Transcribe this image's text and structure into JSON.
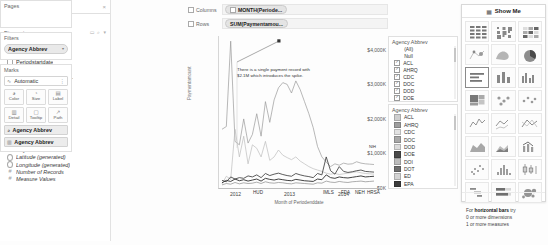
{
  "data_pane": {
    "tabs": [
      {
        "label": "Data",
        "active": true
      },
      {
        "label": "Analytics",
        "active": false
      }
    ],
    "close_glyph": "×",
    "datasource": "OSU_vendor",
    "dimensions_label": "Dimensions",
    "measures_label": "Measures",
    "group_tools": [
      "▭",
      "⌕",
      "▾"
    ],
    "dimensions": [
      {
        "name": "Agency Abbrev",
        "icon": "abc-icon"
      },
      {
        "name": "Agency Text",
        "icon": "abc-icon"
      },
      {
        "name": "Periodenddate",
        "icon": "calendar-icon"
      },
      {
        "name": "Periodstartdate",
        "icon": "calendar-icon"
      },
      {
        "name": "Program Title",
        "icon": "abc-icon"
      },
      {
        "name": "Recipientaccountnum...",
        "icon": "abc-icon"
      },
      {
        "name": "Statecode",
        "icon": "abc-icon"
      },
      {
        "name": "StateName",
        "icon": "globe-icon"
      },
      {
        "name": "Sub Agency Text",
        "icon": "abc-icon"
      }
    ],
    "measures": [
      {
        "name": "Agency",
        "icon": "hash-icon",
        "italic": false
      },
      {
        "name": "Cfda",
        "icon": "hash-icon",
        "italic": false
      },
      {
        "name": "Countycode",
        "icon": "hash-icon",
        "italic": false
      },
      {
        "name": "Fipscode",
        "icon": "hash-icon",
        "italic": false
      },
      {
        "name": "Institutionid",
        "icon": "hash-icon",
        "italic": false
      },
      {
        "name": "Paymentamount",
        "icon": "hash-icon",
        "italic": false
      },
      {
        "name": "Latitude (generated)",
        "icon": "globe-icon",
        "italic": true
      },
      {
        "name": "Longitude (generated)",
        "icon": "globe-icon",
        "italic": true
      },
      {
        "name": "Number of Records",
        "icon": "hash-icon",
        "italic": true
      },
      {
        "name": "Measure Values",
        "icon": "hash-icon",
        "italic": true
      }
    ]
  },
  "cards": {
    "pages": {
      "title": "Pages"
    },
    "filters": {
      "title": "Filters",
      "pills": [
        {
          "label": "Agency Abbrev",
          "caret": "▾"
        }
      ]
    },
    "marks": {
      "title": "Marks",
      "mark_type": "Automatic",
      "mark_type_icon": "line-mark-icon",
      "menu_glyph": "⋮",
      "buttons": [
        {
          "label": "Color",
          "icon": "color-icon",
          "glyph": "◕"
        },
        {
          "label": "Size",
          "icon": "size-icon",
          "glyph": "◔"
        },
        {
          "label": "Label",
          "icon": "label-icon",
          "glyph": "▤"
        },
        {
          "label": "Detail",
          "icon": "detail-icon",
          "glyph": "▥"
        },
        {
          "label": "Tooltip",
          "icon": "tooltip-icon",
          "glyph": "▢"
        },
        {
          "label": "Path",
          "icon": "path-icon",
          "glyph": "↗"
        }
      ],
      "pills": [
        {
          "label": "Agency Abbrev",
          "icon": "color-icon",
          "glyph": "◕"
        },
        {
          "label": "Agency Abbrev",
          "icon": "detail-icon",
          "glyph": "▥"
        }
      ]
    }
  },
  "shelves": [
    {
      "name": "Columns",
      "pill": "MONTH(Periode...",
      "pill_icon": "plus-box-icon"
    },
    {
      "name": "Rows",
      "pill": "SUM(Paymentamou...",
      "pill_icon": ""
    }
  ],
  "chart_data": {
    "type": "line",
    "title": "",
    "xlabel": "Month of Periodenddate",
    "ylabel": "Paymentamount",
    "ytick_labels": [
      "$4,000K",
      "$3,000K",
      "$2,000K",
      "$1,000K",
      "$0K"
    ],
    "ytick_values": [
      4000,
      3000,
      2000,
      1000,
      0
    ],
    "ylim": [
      0,
      4400
    ],
    "grid": false,
    "legend_position": "right",
    "x_year_labels": [
      "2012",
      "2013",
      "2014"
    ],
    "x_end_labels": [
      "HUD",
      "IMLS",
      "FDA",
      "NEH",
      "HRSA"
    ],
    "annotation": "There is a single payment record with $2.1M which introduces the spike.",
    "x": [
      "2012-01",
      "2012-02",
      "2012-03",
      "2012-04",
      "2012-05",
      "2012-06",
      "2012-07",
      "2012-08",
      "2012-09",
      "2012-10",
      "2012-11",
      "2012-12",
      "2013-01",
      "2013-02",
      "2013-03",
      "2013-04",
      "2013-05",
      "2013-06",
      "2013-07",
      "2013-08",
      "2013-09",
      "2013-10",
      "2013-11",
      "2013-12",
      "2014-01",
      "2014-02",
      "2014-03",
      "2014-04",
      "2014-05",
      "2014-06",
      "2014-07",
      "2014-08",
      "2014-09",
      "2014-10",
      "2014-11",
      "2014-12"
    ],
    "series": [
      {
        "name": "HUD",
        "values": [
          1700,
          1780,
          4250,
          1350,
          1250,
          2000,
          1300,
          1550,
          2150,
          1500,
          2500,
          1900,
          2550,
          2900,
          3050,
          3000,
          2750,
          3100,
          2850,
          2500,
          2150,
          1750,
          1200,
          900,
          750,
          620,
          700,
          660,
          720,
          690,
          700,
          760,
          720,
          700,
          690,
          680
        ]
      },
      {
        "name": "IMLS",
        "values": [
          120,
          340,
          250,
          1700,
          900,
          1500,
          700,
          1250,
          1150,
          900,
          1350,
          800,
          900,
          1100,
          950,
          880,
          820,
          900,
          780,
          700,
          620,
          560,
          520,
          480,
          430,
          400,
          420,
          390,
          410,
          430,
          450,
          470,
          440,
          420,
          410,
          400
        ]
      },
      {
        "name": "FDA",
        "values": [
          220,
          180,
          320,
          260,
          300,
          280,
          350,
          320,
          380,
          300,
          420,
          360,
          400,
          430,
          390,
          360,
          340,
          420,
          380,
          350,
          330,
          300,
          420,
          380,
          900,
          500,
          400,
          620,
          480,
          450,
          470,
          500,
          520,
          480,
          470,
          460
        ]
      },
      {
        "name": "NEH",
        "values": [
          150,
          220,
          190,
          260,
          210,
          240,
          200,
          230,
          260,
          200,
          280,
          250,
          230,
          260,
          240,
          220,
          210,
          250,
          230,
          210,
          200,
          190,
          260,
          240,
          380,
          300,
          280,
          320,
          300,
          290,
          310,
          330,
          350,
          320,
          330,
          340
        ]
      },
      {
        "name": "HRSA",
        "values": [
          90,
          130,
          110,
          160,
          120,
          150,
          130,
          140,
          170,
          130,
          180,
          150,
          140,
          160,
          150,
          130,
          120,
          150,
          140,
          130,
          120,
          110,
          150,
          140,
          200,
          170,
          160,
          190,
          170,
          160,
          180,
          190,
          200,
          180,
          190,
          200
        ]
      }
    ]
  },
  "filter_card": {
    "title": "Agency Abbrev",
    "items": [
      {
        "label": "(All)",
        "checked": false,
        "indent": true
      },
      {
        "label": "Null",
        "checked": false,
        "indent": true
      },
      {
        "label": "ACL",
        "checked": true,
        "indent": false
      },
      {
        "label": "AHRQ",
        "checked": true,
        "indent": false
      },
      {
        "label": "CDC",
        "checked": true,
        "indent": false
      },
      {
        "label": "DOC",
        "checked": true,
        "indent": false
      },
      {
        "label": "DOD",
        "checked": true,
        "indent": false
      },
      {
        "label": "DOE",
        "checked": true,
        "indent": false
      }
    ],
    "check_glyph": "✓"
  },
  "color_legend": {
    "title": "Agency Abbrev",
    "items": [
      {
        "label": "ACL",
        "color": "#cfcfcf"
      },
      {
        "label": "AHRQ",
        "color": "#9e9e9e"
      },
      {
        "label": "CDC",
        "color": "#e2e2e2"
      },
      {
        "label": "DOC",
        "color": "#a9a9a9"
      },
      {
        "label": "DOD",
        "color": "#dcdcdc"
      },
      {
        "label": "DOE",
        "color": "#4a4a4a"
      },
      {
        "label": "DOI",
        "color": "#bdbdbd"
      },
      {
        "label": "DOT",
        "color": "#6f6f6f"
      },
      {
        "label": "ED",
        "color": "#d4d4d4"
      },
      {
        "label": "EPA",
        "color": "#3c3c3c"
      }
    ]
  },
  "show_me": {
    "title": "Show Me",
    "icon": "showme-icon",
    "hint_lead": "For",
    "hint_bold": "horizontal bars",
    "hint_tail": "try",
    "hint_line2": "0 or more dimensions",
    "hint_line3": "1 or more measures",
    "cells": [
      {
        "name": "text-table",
        "selected": false
      },
      {
        "name": "heat-map",
        "selected": false
      },
      {
        "name": "highlight-table",
        "selected": false
      },
      {
        "name": "symbol-map",
        "selected": false
      },
      {
        "name": "filled-map",
        "selected": false
      },
      {
        "name": "pie-chart",
        "selected": false
      },
      {
        "name": "horizontal-bars",
        "selected": true
      },
      {
        "name": "stacked-bars",
        "selected": false
      },
      {
        "name": "side-by-side-bars",
        "selected": false
      },
      {
        "name": "treemap",
        "selected": false
      },
      {
        "name": "circle-views",
        "selected": false
      },
      {
        "name": "side-by-side-circles",
        "selected": false
      },
      {
        "name": "continuous-lines",
        "selected": false
      },
      {
        "name": "discrete-lines",
        "selected": false
      },
      {
        "name": "dual-lines",
        "selected": false
      },
      {
        "name": "area-charts-continuous",
        "selected": false
      },
      {
        "name": "area-charts-discrete",
        "selected": false
      },
      {
        "name": "dual-combination",
        "selected": false
      },
      {
        "name": "scatter-plot",
        "selected": false
      },
      {
        "name": "histogram",
        "selected": false
      },
      {
        "name": "box-and-whisker",
        "selected": false
      },
      {
        "name": "gantt",
        "selected": false
      },
      {
        "name": "bullet-graph",
        "selected": false
      },
      {
        "name": "packed-bubbles",
        "selected": false
      }
    ]
  }
}
